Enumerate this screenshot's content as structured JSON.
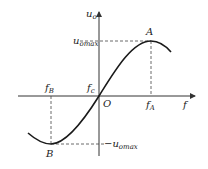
{
  "diagram": {
    "type": "characteristic-curve",
    "axes": {
      "y_label": {
        "main": "u",
        "sub": "o"
      },
      "x_label": "f",
      "origin_label": "O"
    },
    "points": {
      "A": {
        "label": "A",
        "x_label": {
          "main": "f",
          "sub": "A"
        },
        "y_label": {
          "main": "u",
          "sub": "omax"
        }
      },
      "B": {
        "label": "B",
        "x_label": {
          "main": "f",
          "sub": "B"
        },
        "y_label": {
          "prefix": "−",
          "main": "u",
          "sub": "omax"
        }
      },
      "center": {
        "x_label": {
          "main": "f",
          "sub": "c"
        }
      }
    },
    "colors": {
      "line": "#1a1a1a",
      "background": "#ffffff"
    }
  }
}
